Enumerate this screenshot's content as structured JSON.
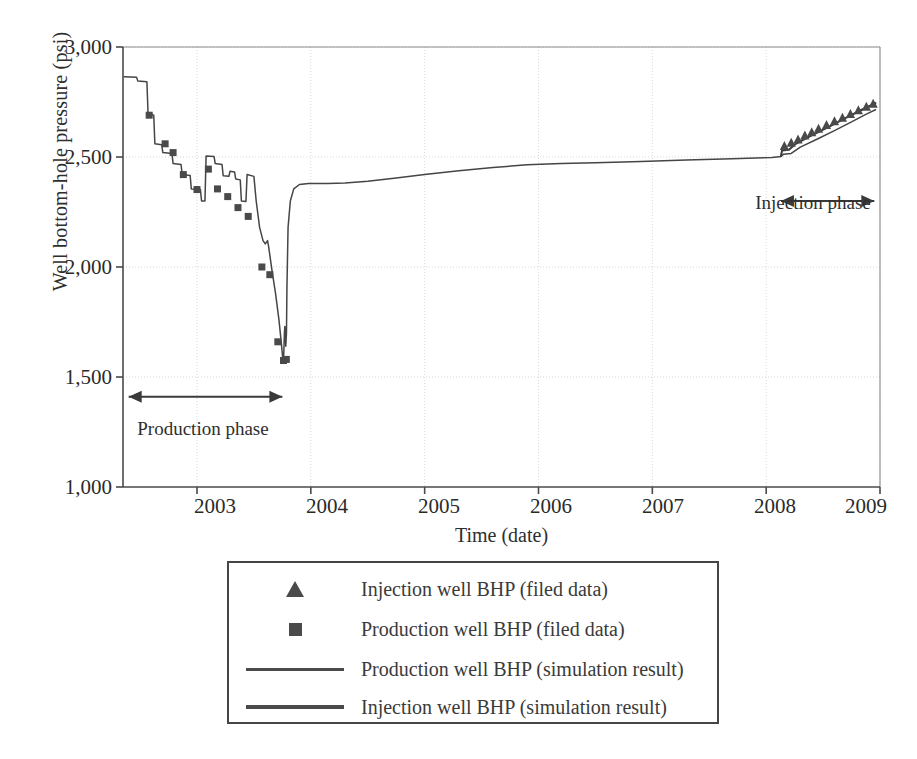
{
  "chart_data": {
    "type": "line",
    "title": "",
    "xlabel": "Time (date)",
    "ylabel": "Well bottom-hole pressure (psi)",
    "xlim": [
      2002.35,
      2009.0
    ],
    "ylim": [
      1000,
      3000
    ],
    "xticks": [
      2003,
      2004,
      2005,
      2006,
      2007,
      2008,
      2009
    ],
    "xticklabels": [
      "2003",
      "2004",
      "2005",
      "2006",
      "2007",
      "2008",
      "2009"
    ],
    "yticks": [
      1000,
      1500,
      2000,
      2500,
      3000
    ],
    "yticklabels": [
      "1,000",
      "1,500",
      "2,000",
      "2,500",
      "3,000"
    ],
    "grid": "dotted-light-gray",
    "legend_position": "below-axes",
    "annotations": [
      {
        "name": "production-phase",
        "text": "Production phase",
        "arrow_from_x": 2002.4,
        "arrow_to_x": 2003.75,
        "arrow_y": 1410
      },
      {
        "name": "injection-phase",
        "text": "Injection phase",
        "arrow_from_x": 2008.13,
        "arrow_to_x": 2008.95,
        "arrow_y": 2300
      }
    ],
    "series": [
      {
        "name": "Production well BHP (simulation result)",
        "style": "line",
        "color": "#454545",
        "points": [
          [
            2002.36,
            2865
          ],
          [
            2002.47,
            2862
          ],
          [
            2002.48,
            2845
          ],
          [
            2002.56,
            2842
          ],
          [
            2002.57,
            2700
          ],
          [
            2002.62,
            2690
          ],
          [
            2002.63,
            2560
          ],
          [
            2002.69,
            2556
          ],
          [
            2002.7,
            2520
          ],
          [
            2002.78,
            2516
          ],
          [
            2002.79,
            2470
          ],
          [
            2002.86,
            2466
          ],
          [
            2002.87,
            2420
          ],
          [
            2002.94,
            2416
          ],
          [
            2002.95,
            2355
          ],
          [
            2003.03,
            2352
          ],
          [
            2003.04,
            2300
          ],
          [
            2003.07,
            2300
          ],
          [
            2003.08,
            2505
          ],
          [
            2003.15,
            2502
          ],
          [
            2003.16,
            2470
          ],
          [
            2003.22,
            2466
          ],
          [
            2003.23,
            2415
          ],
          [
            2003.28,
            2412
          ],
          [
            2003.29,
            2435
          ],
          [
            2003.33,
            2432
          ],
          [
            2003.34,
            2400
          ],
          [
            2003.38,
            2396
          ],
          [
            2003.39,
            2300
          ],
          [
            2003.43,
            2298
          ],
          [
            2003.44,
            2420
          ],
          [
            2003.5,
            2412
          ],
          [
            2003.52,
            2300
          ],
          [
            2003.55,
            2180
          ],
          [
            2003.58,
            2120
          ],
          [
            2003.6,
            2105
          ],
          [
            2003.62,
            2120
          ],
          [
            2003.63,
            2090
          ],
          [
            2003.66,
            1980
          ],
          [
            2003.69,
            1880
          ],
          [
            2003.72,
            1760
          ],
          [
            2003.74,
            1660
          ],
          [
            2003.755,
            1575
          ],
          [
            2003.762,
            1600
          ],
          [
            2003.768,
            1700
          ],
          [
            2003.772,
            1730
          ],
          [
            2003.776,
            1700
          ],
          [
            2003.78,
            1640
          ],
          [
            2003.786,
            1700
          ],
          [
            2003.79,
            1900
          ],
          [
            2003.8,
            2180
          ],
          [
            2003.82,
            2300
          ],
          [
            2003.85,
            2355
          ],
          [
            2003.9,
            2375
          ],
          [
            2003.98,
            2380
          ],
          [
            2004.15,
            2379
          ],
          [
            2004.3,
            2382
          ],
          [
            2004.5,
            2390
          ],
          [
            2004.75,
            2405
          ],
          [
            2005.0,
            2420
          ],
          [
            2005.3,
            2437
          ],
          [
            2005.6,
            2452
          ],
          [
            2005.9,
            2465
          ],
          [
            2006.2,
            2470
          ],
          [
            2006.5,
            2474
          ],
          [
            2006.9,
            2480
          ],
          [
            2007.3,
            2486
          ],
          [
            2007.7,
            2492
          ],
          [
            2008.05,
            2498
          ],
          [
            2008.13,
            2502
          ],
          [
            2008.15,
            2512
          ],
          [
            2008.22,
            2516
          ],
          [
            2008.3,
            2545
          ],
          [
            2008.45,
            2582
          ],
          [
            2008.6,
            2620
          ],
          [
            2008.75,
            2660
          ],
          [
            2008.88,
            2695
          ],
          [
            2008.96,
            2715
          ]
        ]
      },
      {
        "name": "Injection well BHP (simulation result)",
        "style": "line",
        "color": "#3c3c3c",
        "points": [
          [
            2008.13,
            2505
          ],
          [
            2008.14,
            2530
          ],
          [
            2008.2,
            2533
          ],
          [
            2008.26,
            2560
          ],
          [
            2008.4,
            2598
          ],
          [
            2008.55,
            2637
          ],
          [
            2008.7,
            2678
          ],
          [
            2008.84,
            2715
          ],
          [
            2008.96,
            2745
          ]
        ]
      },
      {
        "name": "Production well BHP (filed data)",
        "style": "marker-square",
        "color": "#4a4a4a",
        "points": [
          [
            2002.58,
            2690
          ],
          [
            2002.72,
            2560
          ],
          [
            2002.79,
            2520
          ],
          [
            2002.88,
            2420
          ],
          [
            2003.0,
            2352
          ],
          [
            2003.1,
            2445
          ],
          [
            2003.18,
            2355
          ],
          [
            2003.27,
            2320
          ],
          [
            2003.36,
            2270
          ],
          [
            2003.45,
            2230
          ],
          [
            2003.57,
            2000
          ],
          [
            2003.64,
            1965
          ],
          [
            2003.71,
            1660
          ],
          [
            2003.76,
            1575
          ],
          [
            2003.785,
            1580
          ]
        ]
      },
      {
        "name": "Injection well BHP (filed data)",
        "style": "marker-triangle",
        "color": "#4a4a4a",
        "points": [
          [
            2008.16,
            2550
          ],
          [
            2008.22,
            2565
          ],
          [
            2008.28,
            2580
          ],
          [
            2008.34,
            2598
          ],
          [
            2008.4,
            2612
          ],
          [
            2008.46,
            2628
          ],
          [
            2008.53,
            2645
          ],
          [
            2008.6,
            2662
          ],
          [
            2008.67,
            2678
          ],
          [
            2008.74,
            2695
          ],
          [
            2008.81,
            2712
          ],
          [
            2008.88,
            2728
          ],
          [
            2008.94,
            2742
          ]
        ]
      }
    ]
  },
  "axes": {
    "ylabel": "Well bottom-hole pressure (psi)",
    "xlabel": "Time (date)",
    "yticklabels": [
      "3,000",
      "2,500",
      "2,000",
      "1,500",
      "1,000"
    ],
    "xticklabels": [
      "2003",
      "2004",
      "2005",
      "2006",
      "2007",
      "2008",
      "2009"
    ]
  },
  "annotations": {
    "production_phase": "Production phase",
    "injection_phase": "Injection phase"
  },
  "legend": {
    "items": [
      {
        "key": "triangle-marker",
        "label": "Injection well BHP (filed data)"
      },
      {
        "key": "square-marker",
        "label": "Production well BHP (filed data)"
      },
      {
        "key": "thin-line",
        "label": "Production well BHP (simulation result)"
      },
      {
        "key": "thick-line",
        "label": "Injection well BHP (simulation result)"
      }
    ]
  },
  "colors": {
    "line": "#454545",
    "marker": "#4a4a4a",
    "axis": "#4a4a4a",
    "grid": "#d8d8d8",
    "text": "#2e2e2e"
  },
  "bottom_caption": ""
}
